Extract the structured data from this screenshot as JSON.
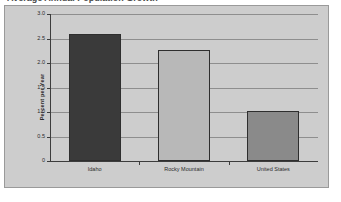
{
  "chart_data": {
    "type": "bar",
    "title": "Average Annual Population Growth",
    "categories": [
      "Idaho",
      "Rocky Mountain",
      "United States"
    ],
    "values": [
      2.6,
      2.27,
      1.02
    ],
    "bar_colors": [
      "#3a3a3a",
      "#b8b8b8",
      "#8a8a8a"
    ],
    "xlabel": "",
    "ylabel": "Percent per Year",
    "ylim": [
      0,
      3.0
    ],
    "ytick_labels": [
      "0",
      "0.5",
      "1.0",
      "1.5",
      "2.0",
      "2.5",
      "3.0"
    ],
    "ytick_values": [
      0,
      0.5,
      1.0,
      1.5,
      2.0,
      2.5,
      3.0
    ],
    "grid": true,
    "legend": false,
    "plot_background": "#cdcdcd",
    "gridline_color": "#8e8e8e",
    "axis_color": "#3c3c3c",
    "frame_border_color": "#9a9a9a"
  }
}
